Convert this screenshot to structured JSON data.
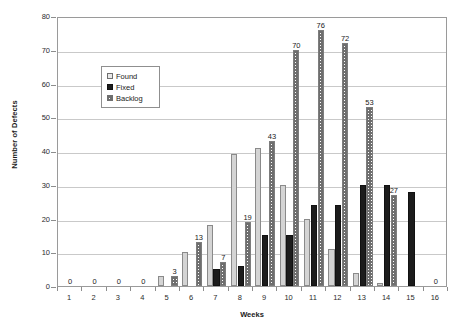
{
  "chart_data": {
    "type": "bar",
    "title": "",
    "xlabel": "Weeks",
    "ylabel": "Number of Defects",
    "categories": [
      "1",
      "2",
      "3",
      "4",
      "5",
      "6",
      "7",
      "8",
      "9",
      "10",
      "11",
      "12",
      "13",
      "14",
      "15",
      "16"
    ],
    "ylim": [
      0,
      80
    ],
    "yticks": [
      0,
      10,
      20,
      30,
      40,
      50,
      60,
      70,
      80
    ],
    "grid": true,
    "legend_position": "inside-upper-left",
    "series": [
      {
        "name": "Found",
        "values": [
          0,
          0,
          0,
          0,
          3,
          10,
          18,
          39,
          41,
          30,
          20,
          11,
          4,
          1,
          0,
          0
        ]
      },
      {
        "name": "Fixed",
        "values": [
          0,
          0,
          0,
          0,
          0,
          0,
          5,
          6,
          15,
          15,
          24,
          24,
          30,
          30,
          28,
          0
        ]
      },
      {
        "name": "Backlog",
        "values": [
          0,
          0,
          0,
          0,
          3,
          13,
          7,
          19,
          43,
          70,
          76,
          72,
          53,
          27,
          0,
          0
        ]
      }
    ],
    "annotations": [
      {
        "week": "1",
        "text": "0"
      },
      {
        "week": "2",
        "text": "0"
      },
      {
        "week": "3",
        "text": "0"
      },
      {
        "week": "4",
        "text": "0"
      },
      {
        "week": "5",
        "text": "3"
      },
      {
        "week": "6",
        "text": "13"
      },
      {
        "week": "7",
        "text": "7"
      },
      {
        "week": "8",
        "text": "19"
      },
      {
        "week": "9",
        "text": "43"
      },
      {
        "week": "10",
        "text": "70"
      },
      {
        "week": "11",
        "text": "76"
      },
      {
        "week": "12",
        "text": "72"
      },
      {
        "week": "13",
        "text": "53"
      },
      {
        "week": "14",
        "text": "27"
      },
      {
        "week": "15",
        "text": "0"
      },
      {
        "week": "16",
        "text": "0"
      }
    ]
  },
  "axes": {
    "y_title": "Number of Defects",
    "x_title": "Weeks",
    "y_tick_labels": [
      "0",
      "10",
      "20",
      "30",
      "40",
      "50",
      "60",
      "70",
      "80"
    ],
    "x_tick_labels": [
      "1",
      "2",
      "3",
      "4",
      "5",
      "6",
      "7",
      "8",
      "9",
      "10",
      "11",
      "12",
      "13",
      "14",
      "15",
      "16"
    ]
  },
  "legend": {
    "items": [
      {
        "label": "Found",
        "swatch": "found-swatch",
        "color": "#e8e8e8"
      },
      {
        "label": "Fixed",
        "swatch": "fixed-swatch",
        "color": "#1c1c1c"
      },
      {
        "label": "Backlog",
        "swatch": "backlog-swatch",
        "color": "#6e6e6e"
      }
    ]
  },
  "colors": {
    "found": "#d4d4d4",
    "fixed": "#1c1c1c",
    "backlog": "#6e6e6e",
    "grid": "#c9c9c9",
    "axis": "#9a9a9a",
    "background": "#ffffff"
  }
}
